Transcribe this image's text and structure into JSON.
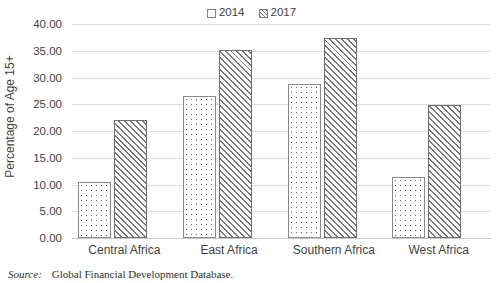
{
  "chart_data": {
    "type": "bar",
    "title": "",
    "xlabel": "",
    "ylabel": "Percentage of Age 15+",
    "ylim": [
      0,
      40
    ],
    "ytick_step": 5,
    "ytick_labels": [
      "40.00",
      "35.00",
      "30.00",
      "25.00",
      "20.00",
      "15.00",
      "10.00",
      "5.00",
      "0.00"
    ],
    "ytick_values": [
      40,
      35,
      30,
      25,
      20,
      15,
      10,
      5,
      0
    ],
    "grid": true,
    "legend_position": "top-center",
    "categories": [
      "Central Africa",
      "East Africa",
      "Southern Africa",
      "West Africa"
    ],
    "series": [
      {
        "name": "2014",
        "pattern": "dots",
        "values": [
          10.5,
          26.5,
          28.7,
          11.4
        ]
      },
      {
        "name": "2017",
        "pattern": "diagonal-hatch",
        "values": [
          22.0,
          35.1,
          37.3,
          24.8
        ]
      }
    ]
  },
  "legend": {
    "entries": [
      {
        "label": "2014"
      },
      {
        "label": "2017"
      }
    ]
  },
  "axes": {
    "y_title": "Percentage of Age 15+"
  },
  "source": {
    "label": "Source:",
    "text": "Global Financial Development Database."
  },
  "colors": {
    "gridline": "#dcdcdc",
    "bar_outline": "#808080",
    "text": "#3f3f3f",
    "background": "#ffffff"
  }
}
